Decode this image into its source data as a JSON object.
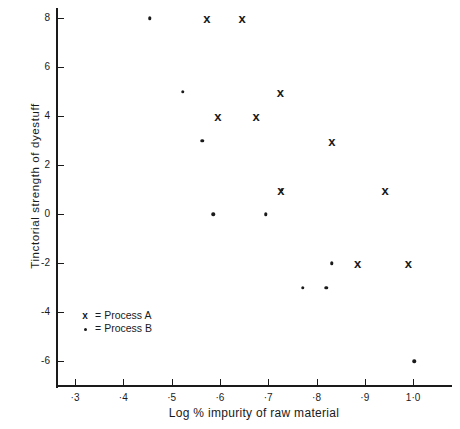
{
  "chart_data": {
    "type": "scatter",
    "title": "",
    "xlabel": "Log % impurity of raw material",
    "ylabel": "Tinctorial strength of dyestuff",
    "xlim": [
      0.255,
      1.075
    ],
    "ylim": [
      -7.2,
      8.8
    ],
    "grid": false,
    "xticks": [
      0.3,
      0.4,
      0.5,
      0.6,
      0.7,
      0.8,
      0.9,
      1.0
    ],
    "xticklabels": [
      "·3",
      "·4",
      "·5",
      "·6",
      "·7",
      "·8",
      "·9",
      "1·0"
    ],
    "yticks": [
      8,
      6,
      4,
      2,
      0,
      -2,
      -4,
      -6
    ],
    "yticklabels": [
      "8",
      "6",
      "4",
      "2",
      "0",
      "-2",
      "-4",
      "-6"
    ],
    "legend_position": "lower-left-inside",
    "series": [
      {
        "name": "Process A",
        "marker": "x",
        "legend_symbol": "x",
        "legend_label": "Process   A",
        "points": [
          {
            "x": 0.573,
            "y": 8
          },
          {
            "x": 0.646,
            "y": 8
          },
          {
            "x": 0.725,
            "y": 5
          },
          {
            "x": 0.596,
            "y": 4
          },
          {
            "x": 0.675,
            "y": 4
          },
          {
            "x": 0.832,
            "y": 3
          },
          {
            "x": 0.726,
            "y": 1
          },
          {
            "x": 0.942,
            "y": 1
          },
          {
            "x": 0.885,
            "y": -2
          },
          {
            "x": 0.99,
            "y": -2
          }
        ]
      },
      {
        "name": "Process B",
        "marker": "dot",
        "legend_symbol": "•",
        "legend_label": "Process   B",
        "points": [
          {
            "x": 0.455,
            "y": 8
          },
          {
            "x": 0.523,
            "y": 5
          },
          {
            "x": 0.563,
            "y": 3
          },
          {
            "x": 0.728,
            "y": 1
          },
          {
            "x": 0.586,
            "y": 0
          },
          {
            "x": 0.695,
            "y": 0
          },
          {
            "x": 0.772,
            "y": -3
          },
          {
            "x": 0.82,
            "y": -3
          },
          {
            "x": 0.832,
            "y": -2
          },
          {
            "x": 1.002,
            "y": -6
          }
        ]
      }
    ]
  }
}
